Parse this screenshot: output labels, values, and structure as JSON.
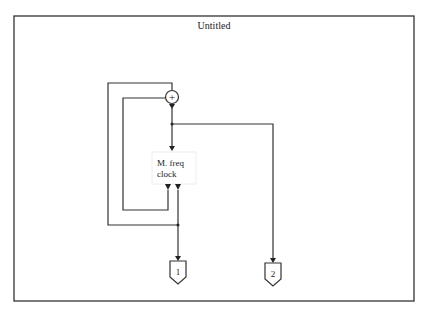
{
  "window": {
    "title": "Untitled"
  },
  "diagram": {
    "sum_block": {
      "symbol": "+"
    },
    "function_block": {
      "line1": "M. freq",
      "line2": "clock"
    },
    "outports": [
      {
        "label": "1"
      },
      {
        "label": "2"
      }
    ]
  }
}
